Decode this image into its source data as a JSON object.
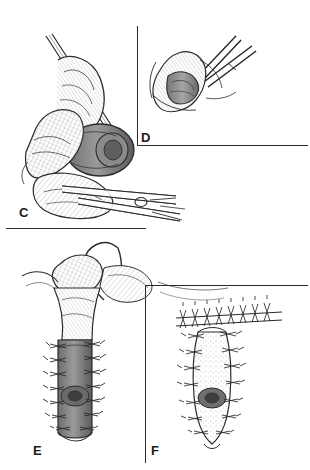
{
  "figure": {
    "background_color": "#ffffff",
    "ink_color": "#2b2b2b",
    "width": 310,
    "height": 470,
    "panels": [
      {
        "id": "C",
        "label": "C",
        "label_x": 19,
        "label_y": 205,
        "region": "upper-left",
        "description": "Exposed tissue flap held open with forceps, hatched shading on flap edges"
      },
      {
        "id": "D",
        "label": "D",
        "label_x": 141,
        "label_y": 130,
        "region": "upper-right",
        "description": "Close-up of tissue cone grasped by fine scissors"
      },
      {
        "id": "E",
        "label": "E",
        "label_x": 33,
        "label_y": 443,
        "region": "lower-left",
        "description": "Suture passed through everted tissue, tubular segment with interrupted stitches"
      },
      {
        "id": "F",
        "label": "F",
        "label_x": 151,
        "label_y": 443,
        "region": "lower-right",
        "description": "Completed anastomosis with circumferential interrupted sutures"
      }
    ],
    "dividers": [
      {
        "name": "vertical-divider-upper",
        "x": 137,
        "y": 26,
        "w": 1.4,
        "h": 120
      },
      {
        "name": "horizontal-divider-upper",
        "x": 137,
        "y": 145,
        "w": 171,
        "h": 1.4
      },
      {
        "name": "horizontal-divider-middle",
        "x": 6,
        "y": 228,
        "w": 140,
        "h": 1.4
      },
      {
        "name": "vertical-divider-lower",
        "x": 145,
        "y": 285,
        "w": 1.4,
        "h": 178
      },
      {
        "name": "horizontal-divider-lower",
        "x": 145,
        "y": 285,
        "w": 163,
        "h": 1.4
      }
    ]
  }
}
